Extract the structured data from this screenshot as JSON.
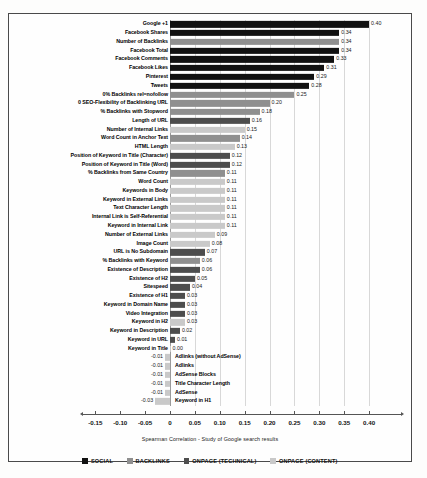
{
  "chart_data": {
    "type": "bar",
    "orientation": "horizontal",
    "title": "",
    "xlabel": "Spearman Correlation - Study of Google search results",
    "ylabel": "",
    "xlim": [
      -0.175,
      0.44
    ],
    "xticks": [
      -0.15,
      -0.1,
      -0.05,
      0,
      0.05,
      0.1,
      0.15,
      0.2,
      0.25,
      0.3,
      0.35,
      0.4
    ],
    "xtick_labels": [
      "-0.15",
      "-0.10",
      "-0.05",
      "0",
      "0.05",
      "0.10",
      "0.15",
      "0.20",
      "0.25",
      "0.30",
      "0.35",
      "0.40"
    ],
    "grid": true,
    "legend_position": "bottom",
    "categories": [
      "Google +1",
      "Facebook Shares",
      "Number of Backlinks",
      "Facebook Total",
      "Facebook Comments",
      "Facebook Likes",
      "Pinterest",
      "Tweets",
      "0% Backlinks rel=nofollow",
      "0 SEO-Flexibility of Backlinking URL",
      "% Backlinks with Stopword",
      "Length of URL",
      "Number of Internal Links",
      "Word Count in Anchor Text",
      "HTML Length",
      "Position of Keyword in Title (Character)",
      "Position of Keyword in Title (Word)",
      "% Backlinks from Same Country",
      "Word Count",
      "Keywords in Body",
      "Keyword in External Links",
      "Text Character Length",
      "Internal Link is Self-Referential",
      "Keyword in Internal Link",
      "Number of External Links",
      "Image Count",
      "URL is No Subdomain",
      "% Backlinks with Keyword",
      "Existence of Description",
      "Existence of H2",
      "Sitespeed",
      "Existence of H1",
      "Keyword in Domain Name",
      "Video Integration",
      "Keyword in H2",
      "Keyword in Description",
      "Keyword in URL",
      "Keyword in Title",
      "Adlinks (without AdSense)",
      "Adlinks",
      "AdSense Blocks",
      "Title Character Length",
      "AdSense",
      "Keyword in H1"
    ],
    "values": [
      0.4,
      0.34,
      0.34,
      0.34,
      0.33,
      0.31,
      0.29,
      0.28,
      0.25,
      0.2,
      0.18,
      0.16,
      0.15,
      0.14,
      0.13,
      0.12,
      0.12,
      0.11,
      0.11,
      0.11,
      0.11,
      0.11,
      0.11,
      0.11,
      0.09,
      0.08,
      0.07,
      0.06,
      0.06,
      0.05,
      0.04,
      0.03,
      0.03,
      0.03,
      0.03,
      0.02,
      0.01,
      0.0,
      -0.01,
      -0.01,
      -0.01,
      -0.01,
      -0.01,
      -0.03
    ],
    "value_labels": [
      "0.40",
      "0.34",
      "0.34",
      "0.34",
      "0.33",
      "0.31",
      "0.29",
      "0.28",
      "0.25",
      "0.20",
      "0.18",
      "0.16",
      "0.15",
      "0.14",
      "0.13",
      "0.12",
      "0.12",
      "0.11",
      "0.11",
      "0.11",
      "0.11",
      "0.11",
      "0.11",
      "0.11",
      "0.09",
      "0.08",
      "0.07",
      "0.06",
      "0.06",
      "0.05",
      "0.04",
      "0.03",
      "0.03",
      "0.03",
      "0.03",
      "0.02",
      "0.01",
      "0.00",
      "-0.01",
      "-0.01",
      "-0.01",
      "-0.01",
      "-0.01",
      "-0.03"
    ],
    "groups": [
      "SOCIAL",
      "SOCIAL",
      "BACKLINKS",
      "SOCIAL",
      "SOCIAL",
      "SOCIAL",
      "SOCIAL",
      "SOCIAL",
      "BACKLINKS",
      "BACKLINKS",
      "BACKLINKS",
      "ONPAGE (TECHNICAL)",
      "ONPAGE (CONTENT)",
      "BACKLINKS",
      "ONPAGE (CONTENT)",
      "ONPAGE (TECHNICAL)",
      "ONPAGE (TECHNICAL)",
      "BACKLINKS",
      "ONPAGE (CONTENT)",
      "ONPAGE (CONTENT)",
      "ONPAGE (CONTENT)",
      "ONPAGE (CONTENT)",
      "ONPAGE (CONTENT)",
      "ONPAGE (CONTENT)",
      "ONPAGE (CONTENT)",
      "ONPAGE (CONTENT)",
      "ONPAGE (TECHNICAL)",
      "BACKLINKS",
      "ONPAGE (TECHNICAL)",
      "ONPAGE (TECHNICAL)",
      "ONPAGE (TECHNICAL)",
      "ONPAGE (TECHNICAL)",
      "ONPAGE (TECHNICAL)",
      "ONPAGE (TECHNICAL)",
      "ONPAGE (CONTENT)",
      "ONPAGE (TECHNICAL)",
      "ONPAGE (TECHNICAL)",
      "ONPAGE (CONTENT)",
      "ONPAGE (CONTENT)",
      "ONPAGE (CONTENT)",
      "ONPAGE (CONTENT)",
      "ONPAGE (CONTENT)",
      "ONPAGE (CONTENT)",
      "ONPAGE (CONTENT)"
    ],
    "series": [
      {
        "name": "SOCIAL",
        "color": "#111111"
      },
      {
        "name": "BACKLINKS",
        "color": "#8f8f8f"
      },
      {
        "name": "ONPAGE (TECHNICAL)",
        "color": "#4d4d4d"
      },
      {
        "name": "ONPAGE (CONTENT)",
        "color": "#c9c9c9"
      }
    ]
  },
  "legend": {
    "items": [
      {
        "label": "SOCIAL",
        "color": "#111111"
      },
      {
        "label": "BACKLINKS",
        "color": "#8f8f8f"
      },
      {
        "label": "ONPAGE (TECHNICAL)",
        "color": "#4d4d4d"
      },
      {
        "label": "ONPAGE (CONTENT)",
        "color": "#c9c9c9"
      }
    ]
  }
}
